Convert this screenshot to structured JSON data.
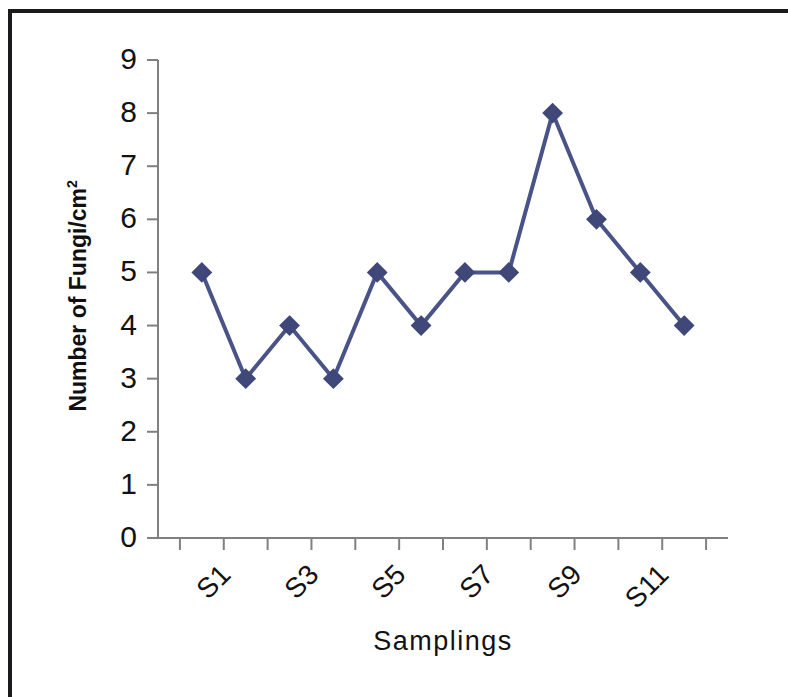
{
  "figure": {
    "background_color": "#ffffff",
    "frame_color": "#1b1a1c"
  },
  "chart_data": {
    "type": "line",
    "title": "",
    "subtitle": "",
    "xlabel": "Samplings",
    "ylabel": "Number of Fungi/cm²",
    "ylabel_base": "Number of Fungi/cm",
    "ylabel_superscript": "2",
    "categories": [
      "S1",
      "S2",
      "S3",
      "S4",
      "S5",
      "S6",
      "S7",
      "S8",
      "S9",
      "S10",
      "S11",
      "S12"
    ],
    "values": [
      5,
      3,
      4,
      3,
      5,
      4,
      5,
      5,
      8,
      6,
      5,
      4
    ],
    "series": [
      {
        "name": "Number of Fungi/cm2",
        "values": [
          5,
          3,
          4,
          3,
          5,
          4,
          5,
          5,
          8,
          6,
          5,
          4
        ],
        "line_color": "#4a5387",
        "marker": "diamond",
        "marker_color": "#3f4878"
      }
    ],
    "ylim": [
      0,
      9
    ],
    "ytick_labels": [
      "0",
      "1",
      "2",
      "3",
      "4",
      "5",
      "6",
      "7",
      "8",
      "9"
    ],
    "ytick_values": [
      0,
      1,
      2,
      3,
      4,
      5,
      6,
      7,
      8,
      9
    ],
    "xtick_labels_visible": [
      "S1",
      "S3",
      "S5",
      "S7",
      "S9",
      "S11"
    ],
    "xtick_label_indices": [
      0,
      2,
      4,
      6,
      8,
      10
    ],
    "grid": false,
    "legend": false,
    "legend_position": "none",
    "axis_color": "#808080"
  }
}
